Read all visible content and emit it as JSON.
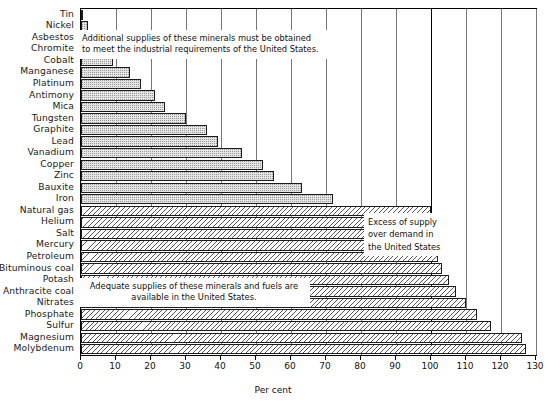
{
  "chart_data": {
    "type": "bar",
    "orientation": "horizontal",
    "title": "",
    "xlabel": "Per cent",
    "ylabel": "",
    "xlim": [
      0,
      130
    ],
    "xticks": [
      0,
      10,
      20,
      30,
      40,
      50,
      60,
      70,
      80,
      90,
      100,
      110,
      120,
      130
    ],
    "xticklabels": [
      "0",
      "10",
      "20",
      "30",
      "40",
      "50",
      "60",
      "70",
      "80",
      "90",
      "100",
      "110",
      "120",
      "130"
    ],
    "grid": true,
    "reference_line": 100,
    "legend": "none",
    "categories": [
      "Tin",
      "Nickel",
      "Asbestos",
      "Chromite",
      "Cobalt",
      "Manganese",
      "Platinum",
      "Antimony",
      "Mica",
      "Tungsten",
      "Graphite",
      "Lead",
      "Vanadium",
      "Copper",
      "Zinc",
      "Bauxite",
      "Iron",
      "Natural gas",
      "Helium",
      "Salt",
      "Mercury",
      "Petroleum",
      "Bituminous coal",
      "Potash",
      "Anthracite coal",
      "Nitrates",
      "Phosphate",
      "Sulfur",
      "Magnesium",
      "Molybdenum"
    ],
    "values": [
      0.5,
      2,
      3,
      8,
      9,
      14,
      17,
      21,
      24,
      30,
      36,
      39,
      46,
      52,
      55,
      63,
      72,
      100,
      100,
      100,
      101,
      102,
      103,
      105,
      107,
      110,
      113,
      117,
      126,
      127
    ],
    "groups": [
      {
        "name": "deficit",
        "fill": "stipple",
        "categories": [
          "Tin",
          "Nickel",
          "Asbestos",
          "Chromite",
          "Cobalt",
          "Manganese",
          "Platinum",
          "Antimony",
          "Mica",
          "Tungsten",
          "Graphite",
          "Lead",
          "Vanadium",
          "Copper",
          "Zinc",
          "Bauxite",
          "Iron"
        ]
      },
      {
        "name": "surplus",
        "fill": "hatch",
        "categories": [
          "Natural gas",
          "Helium",
          "Salt",
          "Mercury",
          "Petroleum",
          "Bituminous coal",
          "Potash",
          "Anthracite coal",
          "Nitrates",
          "Phosphate",
          "Sulfur",
          "Magnesium",
          "Molybdenum"
        ]
      }
    ],
    "annotations": [
      {
        "id": "top",
        "text": "Additional supplies of these minerals must be obtained\nto meet the industrial requirements of the United States."
      },
      {
        "id": "middle",
        "text": "Adequate supplies of these minerals and fuels are\navailable in the United States."
      },
      {
        "id": "right",
        "text": "Excess of supply\nover demand in\nthe United States"
      }
    ],
    "colors": {
      "axis": "#000000",
      "grid": "#767676",
      "bar_outline": "#1c1c1c",
      "stipple_fill": "#e4e4e4",
      "hatch_fill": "#ffffff",
      "background": "#ffffff",
      "text": "#111111"
    }
  }
}
